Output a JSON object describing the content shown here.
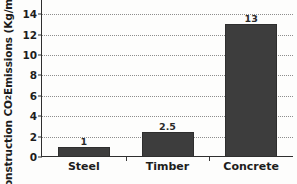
{
  "chart_data": {
    "type": "bar",
    "title": "",
    "xlabel": "",
    "ylabel": "Construction CO2 Emissions (Kg/m2)",
    "ylabel_parts": {
      "prefix": "Construction CO",
      "sub": "2",
      "middle": " Emissions (Kg/m",
      "sup": "2",
      "suffix": ")"
    },
    "categories": [
      "Steel",
      "Timber",
      "Concrete"
    ],
    "values": [
      1,
      2.5,
      13
    ],
    "value_labels": [
      "1",
      "2.5",
      "13"
    ],
    "ylim": [
      0,
      14.6
    ],
    "yticks": [
      0,
      2,
      4,
      6,
      8,
      10,
      12,
      14
    ],
    "ytick_labels": [
      "0",
      "2",
      "4",
      "6",
      "8",
      "10",
      "12",
      "14"
    ],
    "grid": true,
    "grid_style": "dotted-horizontal",
    "legend": "none",
    "bar_color": "#3d3d3d",
    "axis_color": "#2f2f2f",
    "gridline_color": "#8d8d8d",
    "background_color": "#fdfdfc",
    "text_color": "#1d1d1d"
  }
}
